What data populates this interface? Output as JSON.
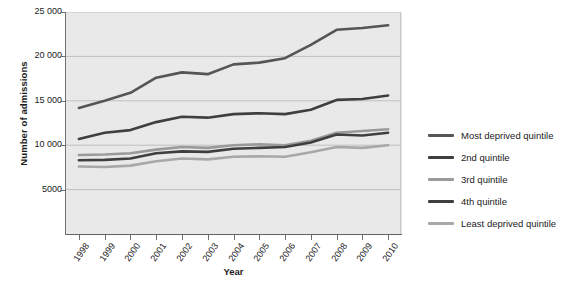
{
  "chart_data": {
    "type": "line",
    "title": "",
    "xlabel": "Year",
    "ylabel": "Number of admissions",
    "categories": [
      "1998",
      "1999",
      "2000",
      "2001",
      "2002",
      "2003",
      "2004",
      "2005",
      "2006",
      "2007",
      "2008",
      "2009",
      "2010"
    ],
    "x": [
      1998,
      1999,
      2000,
      2001,
      2002,
      2003,
      2004,
      2005,
      2006,
      2007,
      2008,
      2009,
      2010
    ],
    "ylim": [
      0,
      25000
    ],
    "yticks": [
      5000,
      10000,
      15000,
      20000,
      25000
    ],
    "ytick_labels": [
      "5000",
      "10 000",
      "15 000",
      "20 000",
      "25 000"
    ],
    "grid": true,
    "grid_axis": "y",
    "legend_position": "right",
    "series": [
      {
        "name": "Most deprived quintile",
        "color": "#555555",
        "values": [
          14200,
          15000,
          15900,
          17600,
          18200,
          18000,
          19100,
          19300,
          19800,
          21300,
          23000,
          23200,
          23500
        ]
      },
      {
        "name": "2nd quintile",
        "color": "#3f3f3f",
        "values": [
          10700,
          11400,
          11700,
          12600,
          13200,
          13100,
          13500,
          13600,
          13500,
          14000,
          15100,
          15200,
          15600
        ]
      },
      {
        "name": "3rd quintile",
        "color": "#9a9a9a",
        "values": [
          8900,
          8950,
          9100,
          9500,
          9800,
          9700,
          10000,
          10100,
          10000,
          10500,
          11400,
          11600,
          11800
        ]
      },
      {
        "name": "4th quintile",
        "color": "#3f3f3f",
        "values": [
          8300,
          8350,
          8500,
          9100,
          9300,
          9250,
          9600,
          9700,
          9800,
          10300,
          11200,
          11100,
          11400
        ]
      },
      {
        "name": "Least deprived quintile",
        "color": "#a8a8a8",
        "values": [
          7600,
          7550,
          7700,
          8200,
          8500,
          8400,
          8700,
          8750,
          8700,
          9200,
          9800,
          9700,
          10000
        ]
      }
    ]
  },
  "axes": {
    "y_title": "Number of admissions",
    "x_title": "Year"
  },
  "colors": {
    "plot_background": "#e9e9e9",
    "gridline": "#bfbfbf",
    "axis": "#6f6f6f",
    "text": "#222222"
  }
}
